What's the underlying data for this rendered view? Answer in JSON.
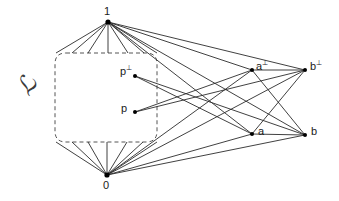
{
  "figure": {
    "kind": "hasse-diagram",
    "caption_symbol": "ℒ",
    "background_color": "#ffffff",
    "line_color": "#2b2b2b",
    "dash_color": "#555555",
    "node_color": "#000000",
    "nodes": [
      {
        "id": "one",
        "label": "1",
        "sup": "",
        "x": 108,
        "y": 22,
        "label_x": 104,
        "label_y": 6,
        "dot": true
      },
      {
        "id": "p-perp",
        "label": "p",
        "sup": "⊥",
        "x": 135,
        "y": 76,
        "label_x": 120,
        "label_y": 66,
        "dot": true
      },
      {
        "id": "p",
        "label": "p",
        "sup": "",
        "x": 135,
        "y": 112,
        "label_x": 121,
        "label_y": 103,
        "dot": true
      },
      {
        "id": "a-perp",
        "label": "a",
        "sup": "⊥",
        "x": 252,
        "y": 70,
        "label_x": 256,
        "label_y": 61,
        "dot": true
      },
      {
        "id": "b-perp",
        "label": "b",
        "sup": "⊥",
        "x": 305,
        "y": 70,
        "label_x": 310,
        "label_y": 61,
        "dot": true
      },
      {
        "id": "a",
        "label": "a",
        "sup": "",
        "x": 252,
        "y": 134,
        "label_x": 258,
        "label_y": 126,
        "dot": true
      },
      {
        "id": "b",
        "label": "b",
        "sup": "",
        "x": 305,
        "y": 135,
        "label_x": 311,
        "label_y": 126,
        "dot": true
      },
      {
        "id": "zero",
        "label": "0",
        "sup": "",
        "x": 107,
        "y": 175,
        "label_x": 103,
        "label_y": 180,
        "dot": true
      }
    ],
    "edges_solid": [
      {
        "from": "one",
        "to": "a-perp"
      },
      {
        "from": "one",
        "to": "b-perp"
      },
      {
        "from": "one",
        "to": "a"
      },
      {
        "from": "one",
        "to": "b"
      },
      {
        "from": "zero",
        "to": "a-perp"
      },
      {
        "from": "zero",
        "to": "b-perp"
      },
      {
        "from": "zero",
        "to": "a"
      },
      {
        "from": "zero",
        "to": "b"
      },
      {
        "from": "p-perp",
        "to": "a"
      },
      {
        "from": "p-perp",
        "to": "b"
      },
      {
        "from": "p",
        "to": "a-perp"
      },
      {
        "from": "p",
        "to": "b-perp"
      },
      {
        "from": "a-perp",
        "to": "b-perp"
      },
      {
        "from": "a",
        "to": "b"
      },
      {
        "from": "a-perp",
        "to": "b"
      },
      {
        "from": "a",
        "to": "b-perp"
      }
    ],
    "fan_top": {
      "apex_x": 108,
      "apex_y": 22,
      "y_end": 53,
      "x_ends": [
        56,
        72,
        88,
        108,
        128,
        144,
        157
      ]
    },
    "fan_bottom": {
      "apex_x": 107,
      "apex_y": 175,
      "y_end": 142,
      "x_ends": [
        56,
        72,
        88,
        107,
        127,
        143,
        157
      ]
    },
    "dashed_box": {
      "left": 55,
      "right": 157,
      "top": 53,
      "bottom": 142,
      "corner": 11
    },
    "script_label": {
      "x": 18,
      "y": 74,
      "text": "ℒ"
    }
  }
}
